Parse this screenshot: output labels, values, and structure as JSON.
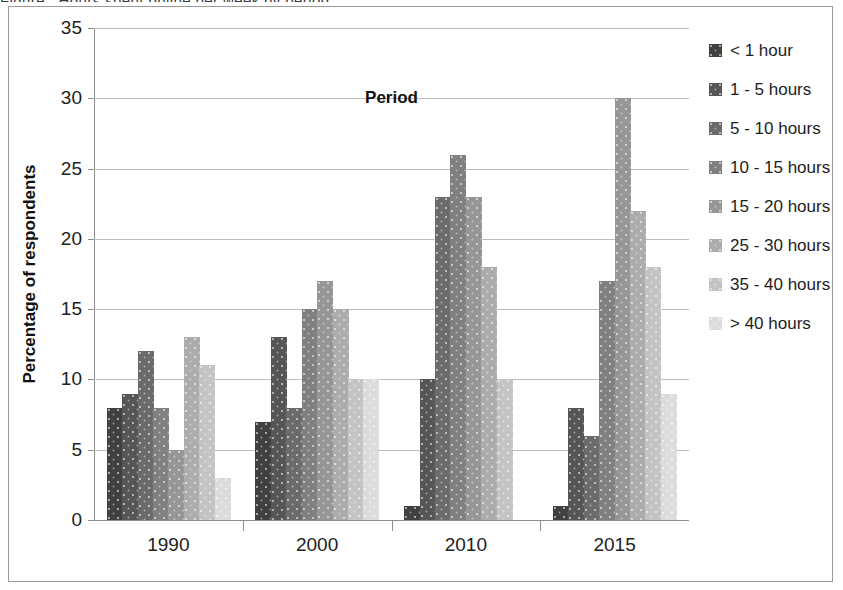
{
  "figure": {
    "caption_bleed": "Figure : Hours spent online per week by period"
  },
  "chart_data": {
    "type": "bar",
    "title": "",
    "subtitle": "",
    "xlabel": "Period",
    "ylabel": "Percentage of respondents",
    "categories": [
      "1990",
      "2000",
      "2010",
      "2015"
    ],
    "ylim": [
      0,
      35
    ],
    "yticks": [
      0,
      5,
      10,
      15,
      20,
      25,
      30,
      35
    ],
    "ytick_labels": [
      "0",
      "5",
      "10",
      "15",
      "20",
      "25",
      "30",
      "35"
    ],
    "grid": "horizontal",
    "legend_position": "right",
    "series": [
      {
        "name": "< 1 hour",
        "color": "#404040",
        "values": [
          8,
          7,
          1,
          1
        ]
      },
      {
        "name": "1 - 5 hours",
        "color": "#565656",
        "values": [
          9,
          13,
          10,
          8
        ]
      },
      {
        "name": "5 - 10 hours",
        "color": "#6b6b6b",
        "values": [
          12,
          8,
          23,
          6
        ]
      },
      {
        "name": "10 - 15 hours",
        "color": "#808080",
        "values": [
          8,
          15,
          26,
          17
        ]
      },
      {
        "name": "15 - 20 hours",
        "color": "#969696",
        "values": [
          5,
          17,
          23,
          30
        ]
      },
      {
        "name": "25 - 30 hours",
        "color": "#acacac",
        "values": [
          13,
          15,
          18,
          22
        ]
      },
      {
        "name": "35 - 40 hours",
        "color": "#c4c4c4",
        "values": [
          11,
          10,
          10,
          18
        ]
      },
      {
        "name": "> 40 hours",
        "color": "#dcdcdc",
        "values": [
          3,
          10,
          0,
          9
        ]
      }
    ]
  },
  "legend": {
    "items": [
      "< 1 hour",
      "1 - 5 hours",
      "5 - 10 hours",
      "10 - 15 hours",
      "15 - 20 hours",
      "25 - 30 hours",
      "35 - 40 hours",
      "> 40 hours"
    ]
  }
}
